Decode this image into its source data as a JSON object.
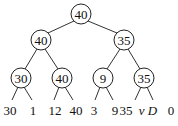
{
  "diagram": {
    "type": "binary-tree",
    "nodes": [
      {
        "id": "root",
        "label": "40",
        "x": 81,
        "y": 14
      },
      {
        "id": "l1",
        "label": "40",
        "x": 41,
        "y": 40
      },
      {
        "id": "r1",
        "label": "35",
        "x": 124,
        "y": 40
      },
      {
        "id": "ll2",
        "label": "30",
        "x": 21,
        "y": 78
      },
      {
        "id": "lr2",
        "label": "40",
        "x": 62,
        "y": 78
      },
      {
        "id": "rl2",
        "label": "9",
        "x": 103,
        "y": 78
      },
      {
        "id": "rr2",
        "label": "35",
        "x": 144,
        "y": 78
      }
    ],
    "leaves": [
      {
        "label": "30",
        "x": 10,
        "italic": false
      },
      {
        "label": "1",
        "x": 33,
        "italic": false
      },
      {
        "label": "12",
        "x": 55,
        "italic": false
      },
      {
        "label": "40",
        "x": 76,
        "italic": false
      },
      {
        "label": "3",
        "x": 94,
        "italic": false
      },
      {
        "label": "9",
        "x": 115,
        "italic": false
      },
      {
        "label": "35",
        "x": 126,
        "italic": false
      },
      {
        "label": "v D",
        "x": 148,
        "italic": true
      },
      {
        "label": "0",
        "x": 171,
        "italic": false
      }
    ],
    "edges": [
      [
        "root",
        "l1"
      ],
      [
        "root",
        "r1"
      ],
      [
        "l1",
        "ll2"
      ],
      [
        "l1",
        "lr2"
      ],
      [
        "r1",
        "rl2"
      ],
      [
        "r1",
        "rr2"
      ]
    ]
  }
}
